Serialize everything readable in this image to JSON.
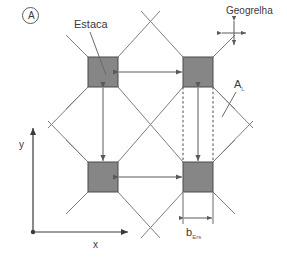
{
  "figure": {
    "tag": "A",
    "background": "#ffffff",
    "line_color": "#6b6b6b",
    "pile_fill": "#868686",
    "pile_stroke": "#4a4a4a",
    "text_color": "#3a3a3a"
  },
  "labels": {
    "estaca": "Estaca",
    "geogrelha": "Geogrelha",
    "area_symbol": "A",
    "area_subscript": "L",
    "dimension_symbol": "b",
    "dimension_subscript": "Ers",
    "axis_x": "x",
    "axis_y": "y"
  },
  "piles": [
    {
      "name": "pile-top-left",
      "x": 88,
      "y": 57,
      "w": 30,
      "h": 30
    },
    {
      "name": "pile-top-right",
      "x": 183,
      "y": 57,
      "w": 30,
      "h": 30
    },
    {
      "name": "pile-bottom-left",
      "x": 88,
      "y": 162,
      "w": 30,
      "h": 30
    },
    {
      "name": "pile-bottom-right",
      "x": 183,
      "y": 162,
      "w": 30,
      "h": 30
    }
  ],
  "dimensions": [
    {
      "name": "spacing-top",
      "orientation": "horizontal"
    },
    {
      "name": "spacing-bottom",
      "orientation": "horizontal"
    },
    {
      "name": "spacing-left",
      "orientation": "vertical"
    },
    {
      "name": "strip-width",
      "orientation": "vertical"
    },
    {
      "name": "pile-width",
      "orientation": "horizontal"
    }
  ]
}
